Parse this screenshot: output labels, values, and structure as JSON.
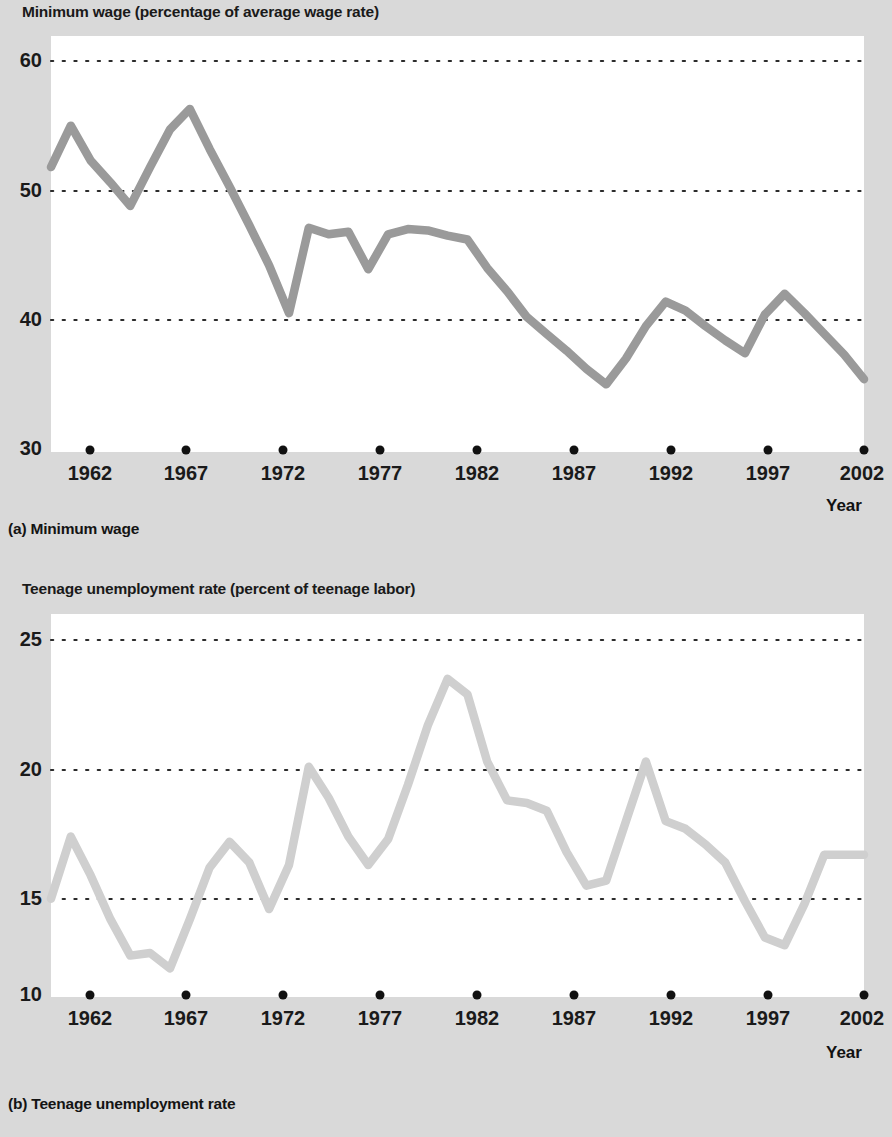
{
  "figure": {
    "background_color": "#d9d9d9",
    "plot_background_color": "#ffffff"
  },
  "panel_a": {
    "title": "Minimum wage (percentage of average wage rate)",
    "caption": "(a) Minimum wage",
    "xaxis_name": "Year",
    "line_color": "#9a9a9a"
  },
  "panel_b": {
    "title": "Teenage unemployment rate (percent of teenage labor)",
    "caption": "(b) Teenage unemployment rate",
    "xaxis_name": "Year",
    "line_color": "#cfcfcf"
  },
  "chart_data": [
    {
      "type": "line",
      "title": "Minimum wage (percentage of average wage rate)",
      "subtitle": "(a) Minimum wage",
      "xlabel": "Year",
      "ylabel": "Minimum wage (percentage of average wage rate)",
      "xlim": [
        1961,
        2002
      ],
      "ylim": [
        30,
        60
      ],
      "xticks": [
        1962,
        1967,
        1972,
        1977,
        1982,
        1987,
        1992,
        1997,
        2002
      ],
      "xtick_labels": [
        "1962",
        "1967",
        "1972",
        "1977",
        "1982",
        "1987",
        "1992",
        "1997",
        "2002"
      ],
      "yticks": [
        30,
        40,
        50,
        60
      ],
      "ytick_labels": [
        "30",
        "40",
        "50",
        "60"
      ],
      "grid": "horizontal-dotted",
      "legend": "none",
      "series": [
        {
          "name": "Minimum wage",
          "color": "#9a9a9a",
          "x": [
            1961,
            1962,
            1963,
            1964,
            1965,
            1966,
            1967,
            1968,
            1969,
            1970,
            1971,
            1972,
            1973,
            1974,
            1975,
            1976,
            1977,
            1978,
            1979,
            1980,
            1981,
            1982,
            1983,
            1984,
            1985,
            1986,
            1987,
            1988,
            1989,
            1990,
            1991,
            1992,
            1993,
            1994,
            1995,
            1996,
            1997,
            1998,
            1999,
            2000,
            2001,
            2002
          ],
          "values": [
            51.8,
            55.0,
            52.3,
            50.6,
            48.8,
            51.8,
            54.7,
            56.3,
            53.2,
            50.3,
            47.3,
            44.2,
            40.5,
            47.1,
            46.6,
            46.8,
            43.9,
            46.6,
            47.0,
            46.9,
            46.5,
            46.2,
            44.0,
            42.2,
            40.2,
            38.9,
            37.6,
            36.2,
            35.0,
            37.0,
            39.5,
            41.4,
            40.7,
            39.5,
            38.4,
            37.4,
            40.4,
            42.0,
            40.5,
            38.9,
            37.3,
            35.4
          ]
        }
      ]
    },
    {
      "type": "line",
      "title": "Teenage unemployment rate (percent of teenage labor)",
      "subtitle": "(b) Teenage unemployment rate",
      "xlabel": "Year",
      "ylabel": "Teenage unemployment rate (percent of teenage labor)",
      "xlim": [
        1961,
        2002
      ],
      "ylim": [
        10,
        25
      ],
      "xticks": [
        1962,
        1967,
        1972,
        1977,
        1982,
        1987,
        1992,
        1997,
        2002
      ],
      "xtick_labels": [
        "1962",
        "1967",
        "1972",
        "1977",
        "1982",
        "1987",
        "1992",
        "1997",
        "2002"
      ],
      "yticks": [
        10,
        15,
        20,
        25
      ],
      "ytick_labels": [
        "10",
        "15",
        "20",
        "25"
      ],
      "grid": "horizontal-dotted",
      "legend": "none",
      "series": [
        {
          "name": "Teenage unemployment rate",
          "color": "#cfcfcf",
          "x": [
            1961,
            1962,
            1963,
            1964,
            1965,
            1966,
            1967,
            1968,
            1969,
            1970,
            1971,
            1972,
            1973,
            1974,
            1975,
            1976,
            1977,
            1978,
            1979,
            1980,
            1981,
            1982,
            1983,
            1984,
            1985,
            1986,
            1987,
            1988,
            1989,
            1990,
            1991,
            1992,
            1993,
            1994,
            1995,
            1996,
            1997,
            1998,
            1999,
            2000,
            2001,
            2002
          ],
          "values": [
            15.0,
            17.4,
            15.9,
            14.2,
            12.8,
            12.9,
            12.3,
            14.2,
            16.2,
            17.2,
            16.4,
            14.6,
            16.3,
            20.1,
            18.9,
            17.4,
            16.3,
            17.3,
            19.4,
            21.7,
            23.5,
            22.9,
            20.3,
            18.8,
            18.7,
            18.4,
            16.8,
            15.5,
            15.7,
            18.0,
            20.3,
            18.0,
            17.7,
            17.1,
            16.4,
            14.9,
            13.5,
            13.2,
            14.8,
            16.7,
            16.7,
            16.7
          ]
        }
      ]
    }
  ]
}
